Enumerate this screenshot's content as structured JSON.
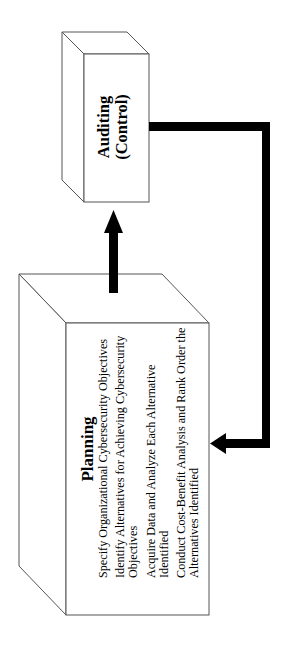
{
  "diagram": {
    "type": "3d-box-flow",
    "orientation": "rotated-90-ccw",
    "boxes": [
      {
        "id": "auditing",
        "title_line1": "Auditing",
        "title_line2": "(Control)"
      },
      {
        "id": "planning",
        "title": "Planning",
        "items": [
          "Specify Organizational Cybersecurity Objectives",
          "Identify Alternatives for Achieving Cybersecurity Objectives",
          "Acquire Data and Analyze Each Alternative Identified",
          "Conduct Cost-Benefit Analysis and Rank Order the Alternatives Identified"
        ]
      }
    ],
    "arrows": [
      {
        "from": "planning",
        "to": "auditing",
        "label": ""
      },
      {
        "from": "auditing",
        "to": "planning",
        "label": "",
        "path": "feedback-loop"
      }
    ],
    "colors": {
      "stroke": "#555555",
      "arrow": "#000000",
      "background": "#ffffff"
    }
  }
}
